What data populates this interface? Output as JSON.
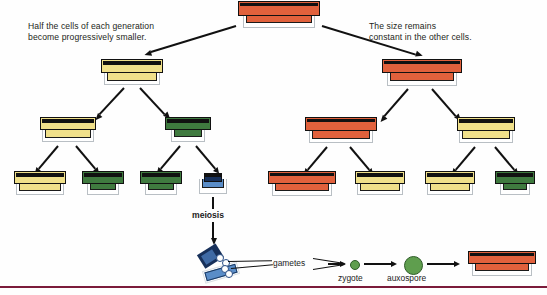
{
  "diagram": {
    "captions": {
      "left": "Half the cells of each generation\nbecome progressively smaller.",
      "right": "The size remains\nconstant in the other cells."
    },
    "labels": {
      "meiosis": "meiosis",
      "gametes": "gametes",
      "zygote": "zygote",
      "auxospore": "auxospore"
    },
    "colors": {
      "orange": "#e1613c",
      "yellow": "#f0e08a",
      "green": "#3f7a3f",
      "blue": "#5a8dc8",
      "zygote_green": "#5f9e4e",
      "auxospore_green": "#5f9e4e",
      "outline_dark": "#111111",
      "frustule_rim": "#b9bfc4",
      "baseline": "#7b1b3a",
      "text": "#231f20",
      "background": "#fefefe"
    },
    "generations": [
      {
        "level": 0,
        "name": "parent-cell",
        "cells": [
          {
            "id": "g0-c1",
            "color": "orange",
            "size": "large",
            "x": 238,
            "y": 2,
            "w": 82,
            "h": 26
          }
        ]
      },
      {
        "level": 1,
        "name": "first-division",
        "cells": [
          {
            "id": "g1-left",
            "color": "yellow",
            "size": "medium",
            "x": 101,
            "y": 60,
            "w": 62,
            "h": 24
          },
          {
            "id": "g1-right",
            "color": "orange",
            "size": "large",
            "x": 382,
            "y": 60,
            "w": 80,
            "h": 25
          }
        ]
      },
      {
        "level": 2,
        "name": "second-division",
        "cells": [
          {
            "id": "g2-a",
            "color": "yellow",
            "size": "medium",
            "x": 40,
            "y": 118,
            "w": 56,
            "h": 23
          },
          {
            "id": "g2-b",
            "color": "green",
            "size": "small",
            "x": 165,
            "y": 118,
            "w": 46,
            "h": 23
          },
          {
            "id": "g2-c",
            "color": "orange",
            "size": "large",
            "x": 305,
            "y": 118,
            "w": 72,
            "h": 24
          },
          {
            "id": "g2-d",
            "color": "yellow",
            "size": "medium",
            "x": 457,
            "y": 118,
            "w": 58,
            "h": 24
          }
        ]
      },
      {
        "level": 3,
        "name": "third-division",
        "cells": [
          {
            "id": "g3-a",
            "color": "yellow",
            "size": "medium",
            "x": 14,
            "y": 172,
            "w": 52,
            "h": 22
          },
          {
            "id": "g3-b",
            "color": "green",
            "size": "small",
            "x": 82,
            "y": 172,
            "w": 42,
            "h": 22
          },
          {
            "id": "g3-c",
            "color": "green",
            "size": "small",
            "x": 140,
            "y": 172,
            "w": 42,
            "h": 22
          },
          {
            "id": "g3-d",
            "color": "blue",
            "size": "tiny",
            "x": 199,
            "y": 174,
            "w": 28,
            "h": 20
          },
          {
            "id": "g3-e",
            "color": "orange",
            "size": "large",
            "x": 268,
            "y": 172,
            "w": 68,
            "h": 23
          },
          {
            "id": "g3-f",
            "color": "yellow",
            "size": "medium",
            "x": 355,
            "y": 172,
            "w": 50,
            "h": 22
          },
          {
            "id": "g3-g",
            "color": "yellow",
            "size": "medium",
            "x": 425,
            "y": 172,
            "w": 50,
            "h": 22
          },
          {
            "id": "g3-h",
            "color": "green",
            "size": "small",
            "x": 495,
            "y": 172,
            "w": 40,
            "h": 22
          }
        ]
      }
    ],
    "sexual_cycle": {
      "meiosis_cell": {
        "id": "meiosis-cell",
        "color": "blue"
      },
      "gamete_circles": 4,
      "zygote": {
        "label": "zygote",
        "diameter": 8,
        "color": "#5f9e4e"
      },
      "auxospore": {
        "label": "auxospore",
        "diameter": 17,
        "color": "#5f9e4e"
      },
      "restored_cell": {
        "id": "restored-cell",
        "color": "orange",
        "size": "large"
      }
    }
  }
}
